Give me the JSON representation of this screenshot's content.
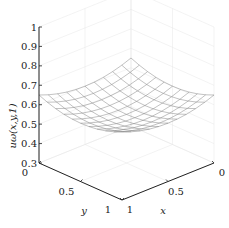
{
  "chart_data": {
    "type": "surface",
    "title": "",
    "xlabel": "x",
    "ylabel": "y",
    "zlabel": "u_{ω}(x,y,1)",
    "zlabel_display": "uω(x,y,1)",
    "xlim": [
      0,
      1
    ],
    "ylim": [
      0,
      1
    ],
    "zlim": [
      0.3,
      1
    ],
    "x_ticks": [
      "0",
      "0.5",
      "1"
    ],
    "y_ticks": [
      "0",
      "0.5",
      "1"
    ],
    "z_ticks": [
      "0.3",
      "0.4",
      "0.5",
      "0.6",
      "0.7",
      "0.8",
      "0.9",
      "1"
    ],
    "grid": true,
    "grid_n": 11,
    "surface_model": "u ≈ 0.55 + 0.2*((x-0.5)^2 + (y-0.5)^2)",
    "surface_samples": {
      "corner_x1_y0": 0.61,
      "corner_x0_y1": 0.59,
      "corner_x0_y0": 0.6,
      "corner_x1_y1": 0.6,
      "center": 0.55
    },
    "colors": {
      "axis": "#222222",
      "grid": "#e6e6e6",
      "mesh": "#777777"
    }
  }
}
